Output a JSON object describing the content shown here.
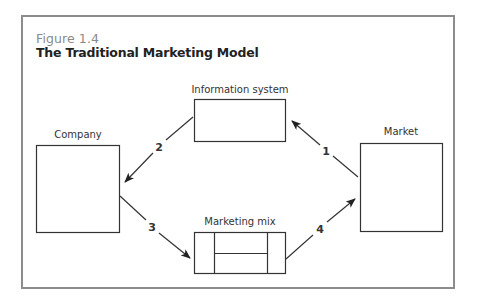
{
  "figure": {
    "number": "Figure 1.4",
    "title": "The Traditional Marketing Model"
  },
  "nodes": {
    "information_system": {
      "label": "Information system"
    },
    "company": {
      "label": "Company"
    },
    "market": {
      "label": "Market"
    },
    "marketing_mix": {
      "label": "Marketing mix"
    }
  },
  "edges": [
    {
      "label": "1",
      "from": "Market",
      "to": "Information system"
    },
    {
      "label": "2",
      "from": "Information system",
      "to": "Company"
    },
    {
      "label": "3",
      "from": "Company",
      "to": "Marketing mix"
    },
    {
      "label": "4",
      "from": "Marketing mix",
      "to": "Market"
    }
  ],
  "colors": {
    "frame": "#8c8c8c",
    "line": "#333333",
    "figure_number": "#8a8a8a",
    "title": "#222222"
  }
}
